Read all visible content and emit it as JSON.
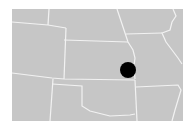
{
  "map": {
    "region": "Central United States",
    "background_color": "#ffffff",
    "land_color": "#c6c6c6",
    "border_color": "#f2f2f2",
    "states_visible": [
      "Nebraska",
      "Iowa",
      "Colorado",
      "Kansas",
      "Missouri",
      "Illinois",
      "New Mexico",
      "Oklahoma",
      "Texas",
      "Arkansas",
      "Wyoming"
    ],
    "marker": {
      "shape": "circle",
      "color": "#000000",
      "location_hint": "Northeast Kansas near Kansas City",
      "cx": 128,
      "cy": 70,
      "r": 8
    }
  }
}
